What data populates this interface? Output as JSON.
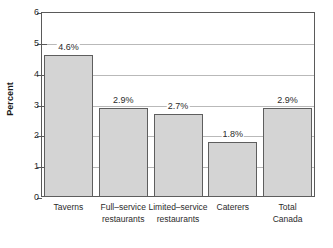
{
  "chart_data": {
    "type": "bar",
    "title": "",
    "subtitle": "",
    "xlabel": "",
    "ylabel": "Percent",
    "ylim": [
      0,
      6
    ],
    "ytick_values": [
      0,
      1,
      2,
      3,
      4,
      5,
      6
    ],
    "ytick_labels": [
      "0",
      "1",
      "2",
      "3",
      "4",
      "5",
      "6"
    ],
    "grid": true,
    "grid_axis": "y",
    "legend": false,
    "legend_position": "none",
    "categories": [
      "Taverns",
      "Full–service\nrestaurants",
      "Limited–service\nrestaurants",
      "Caterers",
      "Total\nCanada"
    ],
    "values": [
      4.6,
      2.9,
      2.7,
      1.8,
      2.9
    ],
    "data_labels": [
      "4.6%",
      "2.9%",
      "2.7%",
      "1.8%",
      "2.9%"
    ],
    "bar_color": "#d4d4d4",
    "bar_edge_color": "#5e5e5e",
    "axis_color": "#5a5a5a",
    "grid_color": "#b9b9b9",
    "text_color": "#2b2b2b",
    "background": "#ffffff"
  }
}
